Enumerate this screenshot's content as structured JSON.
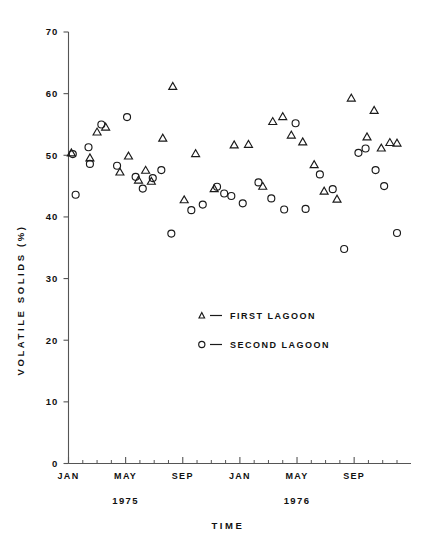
{
  "chart_data": {
    "type": "scatter",
    "title": "",
    "xlabel": "TIME",
    "ylabel": "VOLATILE SOLIDS (%)",
    "ylim": [
      0,
      70
    ],
    "yticks": [
      0,
      10,
      20,
      30,
      40,
      50,
      60,
      70
    ],
    "grid": false,
    "legend_position": "center",
    "x_tick_labels": [
      "JAN",
      "MAY",
      "SEP",
      "JAN",
      "MAY",
      "SEP"
    ],
    "x_tick_months": [
      0,
      4,
      8,
      12,
      16,
      20
    ],
    "x_minor_tick_months": [
      1,
      2,
      3,
      5,
      6,
      7,
      9,
      10,
      11,
      13,
      14,
      15,
      17,
      18,
      19,
      21,
      22,
      23
    ],
    "x_range_months": [
      0,
      23
    ],
    "year_labels": [
      {
        "label": "1975",
        "month": 4
      },
      {
        "label": "1976",
        "month": 16
      }
    ],
    "series": [
      {
        "name": "FIRST LAGOON",
        "marker": "triangle",
        "points": [
          {
            "x": 0.2,
            "y": 50.4
          },
          {
            "x": 1.5,
            "y": 49.6
          },
          {
            "x": 2.0,
            "y": 53.8
          },
          {
            "x": 2.6,
            "y": 54.6
          },
          {
            "x": 3.6,
            "y": 47.3
          },
          {
            "x": 4.2,
            "y": 49.9
          },
          {
            "x": 4.9,
            "y": 46.0
          },
          {
            "x": 5.4,
            "y": 47.6
          },
          {
            "x": 5.8,
            "y": 45.8
          },
          {
            "x": 6.6,
            "y": 52.8
          },
          {
            "x": 7.3,
            "y": 61.2
          },
          {
            "x": 8.1,
            "y": 42.8
          },
          {
            "x": 8.9,
            "y": 50.3
          },
          {
            "x": 10.2,
            "y": 44.6
          },
          {
            "x": 11.6,
            "y": 51.7
          },
          {
            "x": 12.6,
            "y": 51.8
          },
          {
            "x": 13.6,
            "y": 45.0
          },
          {
            "x": 14.3,
            "y": 55.5
          },
          {
            "x": 15.0,
            "y": 56.3
          },
          {
            "x": 15.6,
            "y": 53.3
          },
          {
            "x": 16.4,
            "y": 52.2
          },
          {
            "x": 17.2,
            "y": 48.5
          },
          {
            "x": 17.9,
            "y": 44.2
          },
          {
            "x": 18.8,
            "y": 42.9
          },
          {
            "x": 19.8,
            "y": 59.3
          },
          {
            "x": 20.9,
            "y": 53.0
          },
          {
            "x": 21.4,
            "y": 57.3
          },
          {
            "x": 21.9,
            "y": 51.2
          },
          {
            "x": 22.5,
            "y": 52.1
          },
          {
            "x": 23.0,
            "y": 52.0
          }
        ]
      },
      {
        "name": "SECOND LAGOON",
        "marker": "circle",
        "points": [
          {
            "x": 0.3,
            "y": 50.2
          },
          {
            "x": 0.5,
            "y": 43.6
          },
          {
            "x": 1.4,
            "y": 51.3
          },
          {
            "x": 1.5,
            "y": 48.6
          },
          {
            "x": 2.3,
            "y": 55.0
          },
          {
            "x": 3.4,
            "y": 48.3
          },
          {
            "x": 4.1,
            "y": 56.2
          },
          {
            "x": 4.7,
            "y": 46.5
          },
          {
            "x": 5.2,
            "y": 44.6
          },
          {
            "x": 5.9,
            "y": 46.3
          },
          {
            "x": 6.5,
            "y": 47.6
          },
          {
            "x": 7.2,
            "y": 37.3
          },
          {
            "x": 8.6,
            "y": 41.1
          },
          {
            "x": 9.4,
            "y": 42.0
          },
          {
            "x": 10.4,
            "y": 44.9
          },
          {
            "x": 10.9,
            "y": 43.8
          },
          {
            "x": 11.4,
            "y": 43.4
          },
          {
            "x": 12.2,
            "y": 42.2
          },
          {
            "x": 13.3,
            "y": 45.6
          },
          {
            "x": 14.2,
            "y": 43.0
          },
          {
            "x": 15.1,
            "y": 41.2
          },
          {
            "x": 15.9,
            "y": 55.2
          },
          {
            "x": 16.6,
            "y": 41.3
          },
          {
            "x": 17.6,
            "y": 46.9
          },
          {
            "x": 18.5,
            "y": 44.5
          },
          {
            "x": 19.3,
            "y": 34.8
          },
          {
            "x": 20.3,
            "y": 50.4
          },
          {
            "x": 20.8,
            "y": 51.1
          },
          {
            "x": 21.5,
            "y": 47.6
          },
          {
            "x": 22.1,
            "y": 45.0
          },
          {
            "x": 23.0,
            "y": 37.4
          }
        ]
      }
    ]
  },
  "legend": {
    "entries": [
      {
        "marker": "triangle",
        "dash": "—",
        "label": "FIRST LAGOON"
      },
      {
        "marker": "circle",
        "dash": "—",
        "label": "SECOND LAGOON"
      }
    ]
  },
  "colors": {
    "marker": "#1a1a1a",
    "axis": "#555555",
    "text": "#111111",
    "background": "#ffffff"
  }
}
